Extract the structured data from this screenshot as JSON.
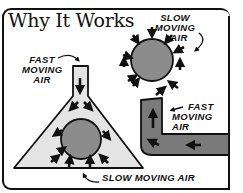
{
  "title": "Why It Works",
  "labels": {
    "top_left": [
      "FAST",
      "MOVING",
      "AIR"
    ],
    "top_right": [
      "SLOW MOVING",
      "AIR"
    ],
    "right_middle": [
      "FAST",
      "MOVING AIR"
    ],
    "bottom": "SLOW MOVING AIR"
  },
  "colors": {
    "outline": "#111111",
    "ball": "#8c8c8c",
    "light_fill": "#e4e4e4",
    "pipe_fill": "#7a7a7a",
    "background": "#ffffff"
  },
  "figures": [
    {
      "name": "ball-in-open-air",
      "description": "Ball surrounded by slow moving air pushing inward"
    },
    {
      "name": "ball-in-funnel",
      "description": "Fast moving air flows down a tube into triangular funnel around ball; slow moving air pushes up from below"
    },
    {
      "name": "l-shaped-pipe",
      "description": "Fast moving air flowing through bent pipe"
    }
  ]
}
